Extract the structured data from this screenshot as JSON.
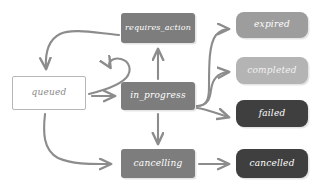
{
  "diagram": {
    "style": "hand-drawn sketch",
    "background_color": "#ffffff",
    "edge_color": "#8c8c8c",
    "nodes": [
      {
        "id": "queued",
        "label": "queued",
        "shape": "rectangle-outline",
        "fill": "#ffffff",
        "border": "#b6b6b6",
        "text_color": "#8a8a8a",
        "x": 12,
        "y": 76,
        "w": 74,
        "h": 34,
        "font_size": 9
      },
      {
        "id": "requires_action",
        "label": "requires_action",
        "shape": "rectangle",
        "fill": "#7d7d7d",
        "text_color": "#ffffff",
        "x": 121,
        "y": 13,
        "w": 74,
        "h": 30,
        "font_size": 8
      },
      {
        "id": "in_progress",
        "label": "in_progress",
        "shape": "rectangle",
        "fill": "#7d7d7d",
        "text_color": "#ffffff",
        "x": 121,
        "y": 82,
        "w": 74,
        "h": 28,
        "font_size": 9
      },
      {
        "id": "cancelling",
        "label": "cancelling",
        "shape": "rectangle",
        "fill": "#7d7d7d",
        "text_color": "#ffffff",
        "x": 121,
        "y": 149,
        "w": 74,
        "h": 29,
        "font_size": 9
      },
      {
        "id": "expired",
        "label": "expired",
        "shape": "rounded-rectangle",
        "fill": "#9d9d9d",
        "text_color": "#ffffff",
        "x": 236,
        "y": 12,
        "w": 72,
        "h": 26,
        "font_size": 9
      },
      {
        "id": "completed",
        "label": "completed",
        "shape": "rounded-rectangle",
        "fill": "#b4b4b4",
        "text_color": "#f2f2f2",
        "x": 236,
        "y": 57,
        "w": 72,
        "h": 27,
        "font_size": 9
      },
      {
        "id": "failed",
        "label": "failed",
        "shape": "rounded-rectangle",
        "fill": "#3f3f3f",
        "text_color": "#ffffff",
        "x": 236,
        "y": 100,
        "w": 72,
        "h": 27,
        "font_size": 9
      },
      {
        "id": "cancelled",
        "label": "cancelled",
        "shape": "rounded-rectangle",
        "fill": "#3f3f3f",
        "text_color": "#ffffff",
        "x": 236,
        "y": 149,
        "w": 72,
        "h": 29,
        "font_size": 9
      }
    ],
    "edges": [
      {
        "from": "requires_action",
        "to": "queued",
        "kind": "curve"
      },
      {
        "from": "in_progress",
        "to": "requires_action",
        "kind": "straight-up"
      },
      {
        "from": "queued",
        "to": "requires_action",
        "kind": "hook-curve"
      },
      {
        "from": "queued",
        "to": "in_progress",
        "kind": "straight-right"
      },
      {
        "from": "queued",
        "to": "cancelling",
        "kind": "curve-down"
      },
      {
        "from": "in_progress",
        "to": "cancelling",
        "kind": "straight-down"
      },
      {
        "from": "in_progress",
        "to": "expired",
        "kind": "fan-up"
      },
      {
        "from": "in_progress",
        "to": "completed",
        "kind": "fan-straight"
      },
      {
        "from": "in_progress",
        "to": "failed",
        "kind": "fan-down"
      },
      {
        "from": "cancelling",
        "to": "cancelled",
        "kind": "straight-right"
      }
    ]
  }
}
